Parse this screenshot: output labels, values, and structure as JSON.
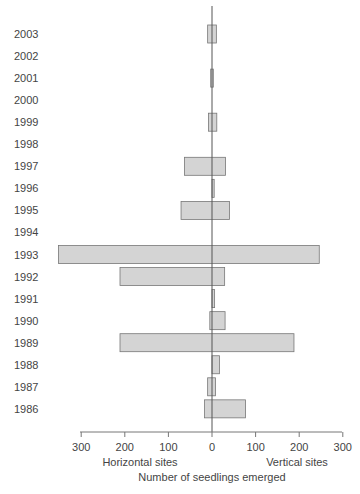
{
  "chart_data": {
    "type": "bar",
    "orientation": "horizontal",
    "layout": "back-to-back (diverging) bars",
    "title": "",
    "xlabel": "Number of seedlings emerged",
    "x_left_label": "Horizontal sites",
    "x_right_label": "Vertical sites",
    "ylabel": "",
    "xlim": [
      -300,
      300
    ],
    "x_ticks": [
      300,
      200,
      100,
      0,
      100,
      200,
      300
    ],
    "grid": false,
    "categories": [
      "2003",
      "2002",
      "2001",
      "2000",
      "1999",
      "1998",
      "1997",
      "1996",
      "1995",
      "1994",
      "1993",
      "1992",
      "1991",
      "1990",
      "1989",
      "1988",
      "1987",
      "1986"
    ],
    "series": [
      {
        "name": "Horizontal sites",
        "values": [
          10,
          0,
          3,
          0,
          8,
          0,
          63,
          0,
          71,
          0,
          352,
          211,
          0,
          5,
          211,
          0,
          10,
          17
        ]
      },
      {
        "name": "Vertical sites",
        "values": [
          10,
          0,
          3,
          0,
          11,
          0,
          31,
          5,
          40,
          0,
          246,
          29,
          6,
          30,
          188,
          17,
          8,
          77
        ]
      }
    ],
    "bar_color": "#d4d4d4",
    "bar_edge_color": "#777777"
  },
  "axis": {
    "tick_labels": [
      "300",
      "200",
      "100",
      "0",
      "100",
      "200",
      "300"
    ],
    "left_label": "Horizontal sites",
    "right_label": "Vertical sites",
    "title": "Number of seedlings emerged"
  }
}
